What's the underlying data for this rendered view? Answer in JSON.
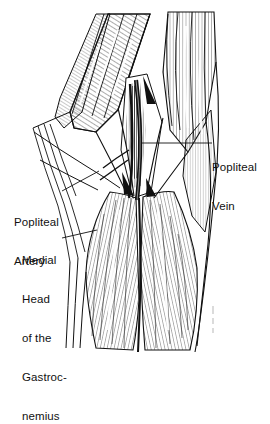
{
  "figure": {
    "background_color": "#ffffff",
    "ink_color": "#111111",
    "width": 270,
    "height": 363
  },
  "labels": {
    "popliteal_vein": {
      "lines": [
        "Popliteal",
        "Vein"
      ],
      "line1": "Popliteal",
      "line2": "Vein"
    },
    "popliteal_artery": {
      "lines": [
        "Popliteal",
        "Artery"
      ],
      "line1": "Popliteal",
      "line2": "Artery"
    },
    "medial_head": {
      "lines": [
        "Medial",
        "Head",
        "of the",
        "Gastroc-",
        "nemius"
      ],
      "line1": "Medial",
      "line2": "Head",
      "line3": "of the",
      "line4": "Gastroc-",
      "line5": "nemius"
    }
  },
  "leader_lines": [
    {
      "name": "vein-leader",
      "from": [
        212,
        143
      ],
      "to": [
        141,
        143
      ]
    },
    {
      "name": "artery-leader",
      "from": [
        62,
        191
      ],
      "to": [
        99,
        171
      ]
    },
    {
      "name": "medial-head-leader",
      "from": [
        62,
        238
      ],
      "to": [
        97,
        230
      ]
    }
  ],
  "structures": [
    {
      "name": "semimembranosus",
      "region": "upper-left"
    },
    {
      "name": "semitendinosus-tendon",
      "region": "left"
    },
    {
      "name": "biceps-femoris",
      "region": "upper-right"
    },
    {
      "name": "popliteal-vein",
      "region": "center"
    },
    {
      "name": "popliteal-artery",
      "region": "center"
    },
    {
      "name": "medial-head-gastrocnemius",
      "region": "lower-left"
    },
    {
      "name": "lateral-head-gastrocnemius",
      "region": "lower-right"
    }
  ],
  "signature": {
    "present": true,
    "text": ""
  }
}
